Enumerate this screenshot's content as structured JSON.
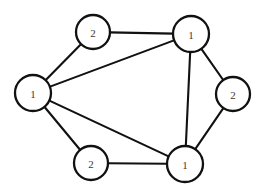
{
  "diagram": {
    "background_color": "#ffffff",
    "stroke_color": "#111111",
    "node_fill_color": "#ffffff",
    "label_color": "#3a3a3a",
    "node_count": 6,
    "edge_count": 9,
    "width": 266,
    "height": 191
  },
  "nodes": [
    {
      "id": "n-top-left",
      "label": "2",
      "cx": 93,
      "cy": 32,
      "r": 17
    },
    {
      "id": "n-top-right",
      "label": "1",
      "cx": 191,
      "cy": 34,
      "r": 18
    },
    {
      "id": "n-left",
      "label": "1",
      "cx": 33,
      "cy": 93,
      "r": 18
    },
    {
      "id": "n-right",
      "label": "2",
      "cx": 233,
      "cy": 94,
      "r": 17
    },
    {
      "id": "n-bottom-left",
      "label": "2",
      "cx": 91,
      "cy": 163,
      "r": 17
    },
    {
      "id": "n-bottom-right",
      "label": "1",
      "cx": 185,
      "cy": 164,
      "r": 18
    }
  ],
  "edges": [
    {
      "id": "e-topleft-topright",
      "from": "n-top-left",
      "to": "n-top-right"
    },
    {
      "id": "e-topleft-left",
      "from": "n-top-left",
      "to": "n-left"
    },
    {
      "id": "e-left-topright",
      "from": "n-left",
      "to": "n-top-right"
    },
    {
      "id": "e-left-bottomright",
      "from": "n-left",
      "to": "n-bottom-right"
    },
    {
      "id": "e-left-bottomleft",
      "from": "n-left",
      "to": "n-bottom-left"
    },
    {
      "id": "e-topright-right",
      "from": "n-top-right",
      "to": "n-right"
    },
    {
      "id": "e-topright-bottomright",
      "from": "n-top-right",
      "to": "n-bottom-right"
    },
    {
      "id": "e-right-bottomright",
      "from": "n-right",
      "to": "n-bottom-right"
    },
    {
      "id": "e-bottomleft-bottomright",
      "from": "n-bottom-left",
      "to": "n-bottom-right"
    }
  ]
}
